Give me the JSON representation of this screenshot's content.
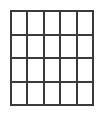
{
  "figure": {
    "type": "rectangular-grid",
    "columns": 5,
    "rows": 4,
    "cell_count": 20,
    "cells_empty": true,
    "line_color": "#3a3a3a",
    "line_width_px": 2,
    "cell_fill_color": "#ffffff",
    "background_color": "#ffffff",
    "grid_bounds": {
      "left_px": 10,
      "top_px": 10,
      "width_px": 84,
      "height_px": 96
    },
    "cells": [
      {
        "row": 1,
        "col": 1,
        "label": ""
      },
      {
        "row": 1,
        "col": 2,
        "label": ""
      },
      {
        "row": 1,
        "col": 3,
        "label": ""
      },
      {
        "row": 1,
        "col": 4,
        "label": ""
      },
      {
        "row": 1,
        "col": 5,
        "label": ""
      },
      {
        "row": 2,
        "col": 1,
        "label": ""
      },
      {
        "row": 2,
        "col": 2,
        "label": ""
      },
      {
        "row": 2,
        "col": 3,
        "label": ""
      },
      {
        "row": 2,
        "col": 4,
        "label": ""
      },
      {
        "row": 2,
        "col": 5,
        "label": ""
      },
      {
        "row": 3,
        "col": 1,
        "label": ""
      },
      {
        "row": 3,
        "col": 2,
        "label": ""
      },
      {
        "row": 3,
        "col": 3,
        "label": ""
      },
      {
        "row": 3,
        "col": 4,
        "label": ""
      },
      {
        "row": 3,
        "col": 5,
        "label": ""
      },
      {
        "row": 4,
        "col": 1,
        "label": ""
      },
      {
        "row": 4,
        "col": 2,
        "label": ""
      },
      {
        "row": 4,
        "col": 3,
        "label": ""
      },
      {
        "row": 4,
        "col": 4,
        "label": ""
      },
      {
        "row": 4,
        "col": 5,
        "label": ""
      }
    ]
  }
}
